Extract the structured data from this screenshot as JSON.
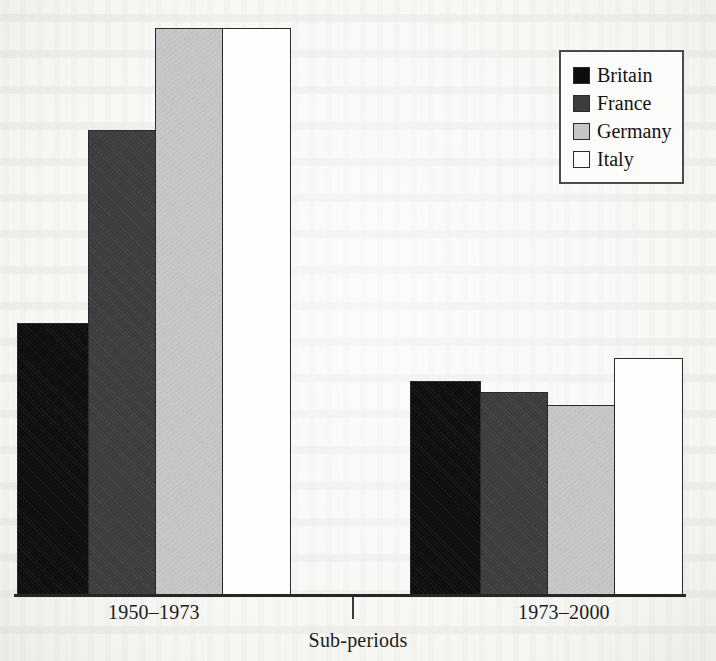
{
  "chart_data": {
    "type": "bar",
    "title": "",
    "subtitle": "",
    "xlabel": "Sub-periods",
    "ylabel": "",
    "categories": [
      "1950–1973",
      "1973–2000"
    ],
    "series": [
      {
        "name": "Britain",
        "color": "#0d0d0d",
        "values": [
          2.4,
          1.9
        ]
      },
      {
        "name": "France",
        "color": "#3c3c3c",
        "values": [
          4.1,
          1.8
        ]
      },
      {
        "name": "Germany",
        "color": "#c6c6c6",
        "values": [
          5.0,
          1.7
        ]
      },
      {
        "name": "Italy",
        "color": "#fdfdfc",
        "values": [
          5.0,
          2.1
        ]
      }
    ],
    "ylim": [
      0,
      5.25
    ],
    "grid": false,
    "axis_ticks_visible": true,
    "legend": {
      "position": "top-right",
      "entries": [
        "Britain",
        "France",
        "Germany",
        "Italy"
      ]
    }
  },
  "axis": {
    "x_title": "Sub-periods",
    "tick_labels": [
      "1950–1973",
      "1973–2000"
    ]
  },
  "legend": {
    "items": [
      {
        "label": "Britain",
        "swatch": "swatch-britain"
      },
      {
        "label": "France",
        "swatch": "swatch-france"
      },
      {
        "label": "Germany",
        "swatch": "swatch-germany"
      },
      {
        "label": "Italy",
        "swatch": "swatch-italy"
      }
    ]
  },
  "bars": {
    "group_1950_1973": [
      {
        "name": "Britain",
        "class": "swatch-britain",
        "left": 1,
        "width": 72,
        "height": 272
      },
      {
        "name": "France",
        "class": "swatch-france",
        "left": 72,
        "width": 68,
        "height": 465
      },
      {
        "name": "Germany",
        "class": "swatch-germany",
        "left": 139,
        "width": 68,
        "height": 567
      },
      {
        "name": "Italy",
        "class": "swatch-italy",
        "left": 206,
        "width": 69,
        "height": 567
      }
    ],
    "group_1973_2000": [
      {
        "name": "Britain",
        "class": "swatch-britain",
        "left": 394,
        "width": 71,
        "height": 214
      },
      {
        "name": "France",
        "class": "swatch-france",
        "left": 464,
        "width": 68,
        "height": 203
      },
      {
        "name": "Germany",
        "class": "swatch-germany",
        "left": 531,
        "width": 68,
        "height": 190
      },
      {
        "name": "Italy",
        "class": "swatch-italy",
        "left": 598,
        "width": 69,
        "height": 237
      }
    ]
  }
}
